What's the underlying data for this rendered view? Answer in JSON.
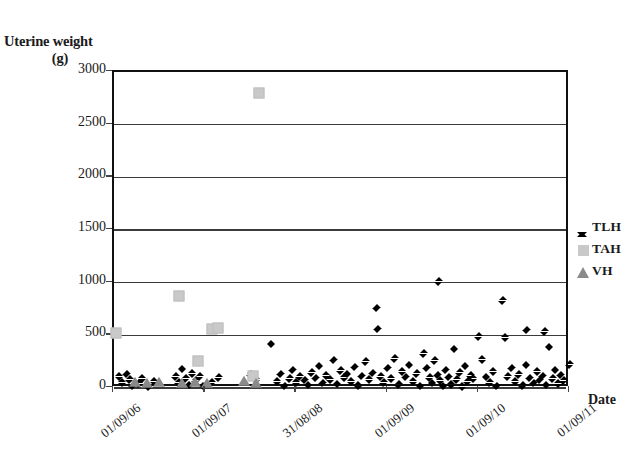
{
  "chart_data": {
    "type": "scatter",
    "title": "",
    "ylabel": "Uterine weight (g)",
    "ylabel_line1": "Uterine weight",
    "ylabel_line2": "(g)",
    "xlabel": "Date",
    "ylim": [
      0,
      3000
    ],
    "y_ticks": [
      3000,
      2500,
      2000,
      1500,
      1000,
      500,
      0
    ],
    "x_tick_labels": [
      "01/09/06",
      "01/09/07",
      "31/08/08",
      "01/09/09",
      "01/09/10",
      "01/09/11"
    ],
    "x_tick_positions": [
      0.0,
      0.2,
      0.4,
      0.6,
      0.8,
      1.0
    ],
    "grid": "horizontal",
    "legend_position": "right",
    "colors": {
      "tlh": "#000000",
      "tah": "#c9c9c9",
      "vh": "#8a8a8a",
      "axis": "#111111",
      "gridline": "#3a3a3a",
      "background": "#ffffff"
    },
    "series": [
      {
        "name": "TLH",
        "marker": "diamond",
        "color": "#000000",
        "points": [
          [
            0.012,
            150
          ],
          [
            0.018,
            95
          ],
          [
            0.028,
            175
          ],
          [
            0.034,
            120
          ],
          [
            0.041,
            60
          ],
          [
            0.055,
            85
          ],
          [
            0.062,
            130
          ],
          [
            0.075,
            55
          ],
          [
            0.088,
            105
          ],
          [
            0.135,
            150
          ],
          [
            0.142,
            95
          ],
          [
            0.15,
            220
          ],
          [
            0.158,
            130
          ],
          [
            0.165,
            70
          ],
          [
            0.172,
            180
          ],
          [
            0.18,
            110
          ],
          [
            0.188,
            150
          ],
          [
            0.196,
            60
          ],
          [
            0.215,
            95
          ],
          [
            0.23,
            140
          ],
          [
            0.3,
            170
          ],
          [
            0.312,
            120
          ],
          [
            0.345,
            460
          ],
          [
            0.358,
            100
          ],
          [
            0.366,
            175
          ],
          [
            0.374,
            60
          ],
          [
            0.385,
            130
          ],
          [
            0.392,
            210
          ],
          [
            0.4,
            95
          ],
          [
            0.408,
            150
          ],
          [
            0.418,
            115
          ],
          [
            0.426,
            70
          ],
          [
            0.434,
            190
          ],
          [
            0.442,
            135
          ],
          [
            0.45,
            250
          ],
          [
            0.458,
            90
          ],
          [
            0.466,
            160
          ],
          [
            0.474,
            120
          ],
          [
            0.482,
            305
          ],
          [
            0.49,
            80
          ],
          [
            0.498,
            205
          ],
          [
            0.505,
            140
          ],
          [
            0.512,
            175
          ],
          [
            0.52,
            100
          ],
          [
            0.528,
            240
          ],
          [
            0.536,
            65
          ],
          [
            0.544,
            155
          ],
          [
            0.552,
            290
          ],
          [
            0.56,
            120
          ],
          [
            0.568,
            185
          ],
          [
            0.576,
            800
          ],
          [
            0.578,
            600
          ],
          [
            0.585,
            150
          ],
          [
            0.592,
            95
          ],
          [
            0.6,
            230
          ],
          [
            0.608,
            130
          ],
          [
            0.616,
            320
          ],
          [
            0.624,
            75
          ],
          [
            0.632,
            195
          ],
          [
            0.64,
            145
          ],
          [
            0.648,
            260
          ],
          [
            0.656,
            105
          ],
          [
            0.664,
            180
          ],
          [
            0.672,
            60
          ],
          [
            0.68,
            370
          ],
          [
            0.686,
            230
          ],
          [
            0.692,
            140
          ],
          [
            0.698,
            90
          ],
          [
            0.704,
            300
          ],
          [
            0.71,
            165
          ],
          [
            0.716,
            110
          ],
          [
            0.722,
            60
          ],
          [
            0.728,
            210
          ],
          [
            0.734,
            145
          ],
          [
            0.74,
            75
          ],
          [
            0.746,
            410
          ],
          [
            0.752,
            120
          ],
          [
            0.758,
            190
          ],
          [
            0.764,
            55
          ],
          [
            0.77,
            250
          ],
          [
            0.776,
            100
          ],
          [
            0.782,
            160
          ],
          [
            0.788,
            130
          ],
          [
            0.712,
            1050
          ],
          [
            0.8,
            530
          ],
          [
            0.808,
            310
          ],
          [
            0.816,
            145
          ],
          [
            0.824,
            95
          ],
          [
            0.832,
            195
          ],
          [
            0.84,
            60
          ],
          [
            0.852,
            870
          ],
          [
            0.858,
            520
          ],
          [
            0.864,
            150
          ],
          [
            0.872,
            230
          ],
          [
            0.88,
            105
          ],
          [
            0.888,
            170
          ],
          [
            0.896,
            65
          ],
          [
            0.904,
            260
          ],
          [
            0.912,
            135
          ],
          [
            0.92,
            90
          ],
          [
            0.928,
            200
          ],
          [
            0.934,
            115
          ],
          [
            0.94,
            155
          ],
          [
            0.948,
            70
          ],
          [
            0.905,
            590
          ],
          [
            0.945,
            580
          ],
          [
            0.955,
            430
          ],
          [
            0.962,
            130
          ],
          [
            0.968,
            210
          ],
          [
            0.974,
            85
          ],
          [
            0.98,
            165
          ],
          [
            0.986,
            110
          ],
          [
            1.0,
            265
          ]
        ]
      },
      {
        "name": "TAH",
        "marker": "square",
        "color": "#c9c9c9",
        "points": [
          [
            0.005,
            520
          ],
          [
            0.142,
            870
          ],
          [
            0.215,
            560
          ],
          [
            0.228,
            565
          ],
          [
            0.185,
            255
          ],
          [
            0.305,
            115
          ],
          [
            0.318,
            2800
          ]
        ]
      },
      {
        "name": "VH",
        "marker": "triangle",
        "color": "#8a8a8a",
        "points": [
          [
            0.045,
            45
          ],
          [
            0.072,
            40
          ],
          [
            0.098,
            50
          ],
          [
            0.15,
            35
          ],
          [
            0.178,
            45
          ],
          [
            0.205,
            40
          ],
          [
            0.285,
            55
          ],
          [
            0.312,
            35
          ]
        ]
      }
    ]
  },
  "legend": {
    "items": [
      {
        "label": "TLH",
        "marker": "diamond"
      },
      {
        "label": "TAH",
        "marker": "square"
      },
      {
        "label": "VH",
        "marker": "triangle"
      }
    ]
  }
}
